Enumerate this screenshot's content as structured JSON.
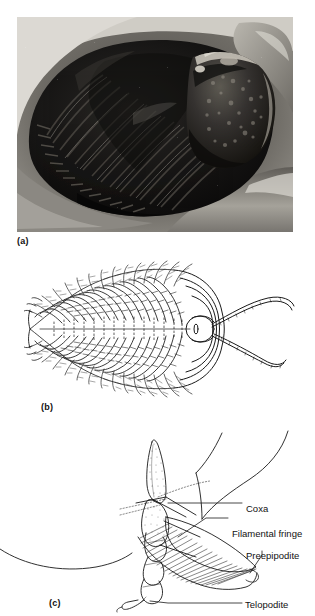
{
  "figure": {
    "panels": [
      {
        "id": "a",
        "label": "(a)",
        "kind": "photograph",
        "subject": "trilobite fossil in rock matrix, dorsal view"
      },
      {
        "id": "b",
        "label": "(b)",
        "kind": "line-drawing",
        "subject": "trilobite ventral reconstruction with biramous appendages and antennae"
      },
      {
        "id": "c",
        "label": "(c)",
        "kind": "line-drawing",
        "subject": "detail of a single biramous trilobite limb"
      }
    ]
  },
  "annotations": {
    "coxa": "Coxa",
    "filamental_fringe": "Filamental fringe",
    "preepipodite": "Preepipodite",
    "telopodite": "Telopodite"
  },
  "colors": {
    "ink": "#111111",
    "line": "#1a1a1a",
    "paper": "#ffffff",
    "photo_dark": "#151515",
    "photo_mid": "#5a5a58",
    "photo_light": "#c8c6c0"
  }
}
